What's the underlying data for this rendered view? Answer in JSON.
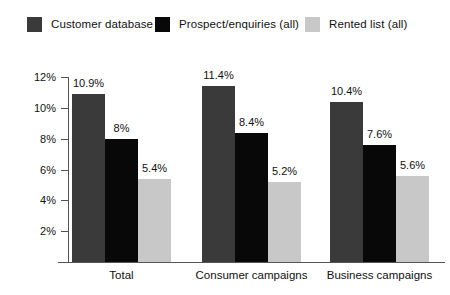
{
  "chart_data": {
    "type": "bar",
    "title": "",
    "subtitle": "",
    "xlabel": "",
    "ylabel": "",
    "categories": [
      "Total",
      "Consumer campaigns",
      "Business campaigns"
    ],
    "series": [
      {
        "name": "Customer database",
        "color": "#3a3a3a",
        "values": [
          10.9,
          11.4,
          10.4
        ],
        "labels": [
          "10.9%",
          "11.4%",
          "10.4%"
        ]
      },
      {
        "name": "Prospect/enquiries (all)",
        "color": "#080808",
        "values": [
          8.0,
          8.4,
          7.6
        ],
        "labels": [
          "8%",
          "8.4%",
          "7.6%"
        ]
      },
      {
        "name": "Rented list (all)",
        "color": "#c8c8c8",
        "values": [
          5.4,
          5.2,
          5.6
        ],
        "labels": [
          "5.4%",
          "5.2%",
          "5.6%"
        ]
      }
    ],
    "ylim": [
      0,
      12
    ],
    "yticks": [
      2,
      4,
      6,
      8,
      10,
      12
    ],
    "ytick_labels": [
      "2%",
      "4%",
      "6%",
      "8%",
      "10%",
      "12%"
    ],
    "grid": false,
    "legend_position": "top-left",
    "value_labels_shown": true
  },
  "legend": {
    "items": [
      {
        "label": "Customer database",
        "color": "#3a3a3a"
      },
      {
        "label": "Prospect/enquiries (all)",
        "color": "#080808"
      },
      {
        "label": "Rented list (all)",
        "color": "#c8c8c8"
      }
    ]
  },
  "axes": {
    "y_tick_labels": [
      "12%",
      "10%",
      "8%",
      "6%",
      "4%",
      "2%"
    ],
    "x_category_labels": [
      "Total",
      "Consumer campaigns",
      "Business campaigns"
    ]
  }
}
